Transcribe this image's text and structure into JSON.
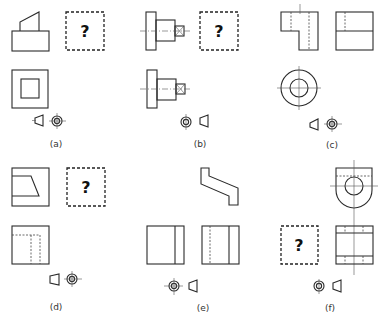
{
  "figure": {
    "question_mark": "?",
    "panels": [
      {
        "id": "a",
        "caption": "(a)",
        "missing_view": "top-right",
        "projection_symbol_order": [
          "truncated-cone",
          "concentric-circles"
        ]
      },
      {
        "id": "b",
        "caption": "(b)",
        "missing_view": "top-right",
        "projection_symbol_order": [
          "concentric-circles",
          "truncated-cone"
        ]
      },
      {
        "id": "c",
        "caption": "(c)",
        "missing_view": "none",
        "projection_symbol_order": [
          "truncated-cone",
          "concentric-circles"
        ]
      },
      {
        "id": "d",
        "caption": "(d)",
        "missing_view": "top-right",
        "projection_symbol_order": [
          "truncated-cone",
          "concentric-circles"
        ]
      },
      {
        "id": "e",
        "caption": "(e)",
        "missing_view": "none",
        "projection_symbol_order": [
          "concentric-circles",
          "truncated-cone"
        ]
      },
      {
        "id": "f",
        "caption": "(f)",
        "missing_view": "bottom-left",
        "projection_symbol_order": [
          "concentric-circles",
          "truncated-cone"
        ]
      }
    ]
  }
}
